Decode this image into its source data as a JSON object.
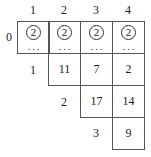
{
  "diagram": {
    "column_headers": [
      "1",
      "2",
      "3",
      "4"
    ],
    "row0": {
      "label": "0",
      "cells": [
        {
          "circled": "2",
          "dots": "..."
        },
        {
          "circled": "2",
          "dots": "..."
        },
        {
          "circled": "2",
          "dots": "..."
        },
        {
          "circled": "2",
          "dots": "..."
        }
      ]
    },
    "rows": [
      {
        "label": "1",
        "values": [
          "11",
          "7",
          "2"
        ]
      },
      {
        "label": "2",
        "values": [
          "17",
          "14"
        ]
      },
      {
        "label": "3",
        "values": [
          "9"
        ]
      }
    ]
  }
}
